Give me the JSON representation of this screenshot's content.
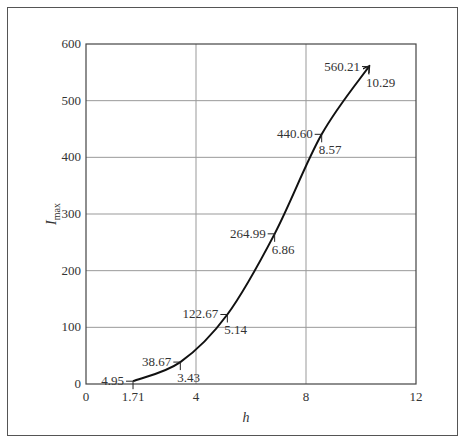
{
  "chart_data": {
    "type": "line",
    "title": "",
    "xlabel": "h",
    "ylabel": "I",
    "ylabel_subscript": "max",
    "xlim": [
      0,
      12
    ],
    "ylim": [
      0,
      600
    ],
    "xticks": [
      0,
      4,
      8,
      12
    ],
    "yticks": [
      0,
      100,
      200,
      300,
      400,
      500,
      600
    ],
    "grid": true,
    "legend": null,
    "series": [
      {
        "name": "I_max vs h",
        "x": [
          1.71,
          3.43,
          5.14,
          6.86,
          8.57,
          10.29
        ],
        "y": [
          4.95,
          38.67,
          122.67,
          264.99,
          440.6,
          560.21
        ],
        "end_marker": "arrow"
      }
    ],
    "annotations": [
      {
        "x": 1.71,
        "y": 4.95,
        "y_label": "4.95",
        "x_label": "1.71"
      },
      {
        "x": 3.43,
        "y": 38.67,
        "y_label": "38.67",
        "x_label": "3.43"
      },
      {
        "x": 5.14,
        "y": 122.67,
        "y_label": "122.67",
        "x_label": "5.14"
      },
      {
        "x": 6.86,
        "y": 264.99,
        "y_label": "264.99",
        "x_label": "6.86"
      },
      {
        "x": 8.57,
        "y": 440.6,
        "y_label": "440.60",
        "x_label": "8.57"
      },
      {
        "x": 10.29,
        "y": 560.21,
        "y_label": "560.21",
        "x_label": "10.29"
      }
    ]
  }
}
